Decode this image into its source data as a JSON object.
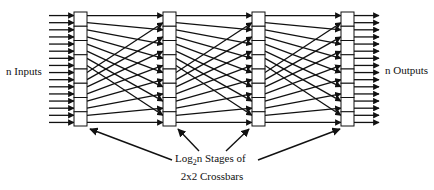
{
  "diagram": {
    "type": "omega-network",
    "num_lines": 16,
    "num_stages": 4,
    "switches_per_stage": 8,
    "interconnect": "perfect-shuffle",
    "input_label": "n Inputs",
    "output_label": "n Outputs",
    "caption": {
      "line1_prefix": "Log",
      "line1_subscript": "2",
      "line1_suffix": "n Stages of",
      "line2": "2x2 Crossbars"
    },
    "colors": {
      "line": "#111111",
      "box_fill": "#ffffff",
      "background": "#ffffff"
    }
  }
}
